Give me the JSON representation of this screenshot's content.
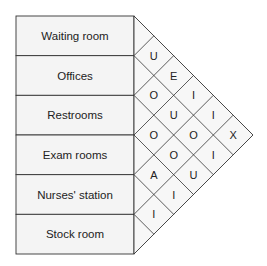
{
  "diagram": {
    "type": "activity-relationship-chart",
    "departments": [
      "Waiting room",
      "Offices",
      "Restrooms",
      "Exam rooms",
      "Nurses' station",
      "Stock room"
    ],
    "relationships": [
      {
        "from": 0,
        "to": 1,
        "code": "U"
      },
      {
        "from": 1,
        "to": 2,
        "code": "O"
      },
      {
        "from": 2,
        "to": 3,
        "code": "O"
      },
      {
        "from": 3,
        "to": 4,
        "code": "A"
      },
      {
        "from": 4,
        "to": 5,
        "code": "I"
      },
      {
        "from": 0,
        "to": 2,
        "code": "E"
      },
      {
        "from": 1,
        "to": 3,
        "code": "U"
      },
      {
        "from": 2,
        "to": 4,
        "code": "O"
      },
      {
        "from": 3,
        "to": 5,
        "code": "I"
      },
      {
        "from": 0,
        "to": 3,
        "code": "I"
      },
      {
        "from": 1,
        "to": 4,
        "code": "O"
      },
      {
        "from": 2,
        "to": 5,
        "code": "U"
      },
      {
        "from": 0,
        "to": 4,
        "code": "I"
      },
      {
        "from": 1,
        "to": 5,
        "code": "I"
      },
      {
        "from": 0,
        "to": 5,
        "code": "X"
      }
    ],
    "colors": {
      "box_fill": "#f4f4f4",
      "grid_fill": "#f7f7f7",
      "line": "#333333",
      "text": "#222222"
    }
  }
}
